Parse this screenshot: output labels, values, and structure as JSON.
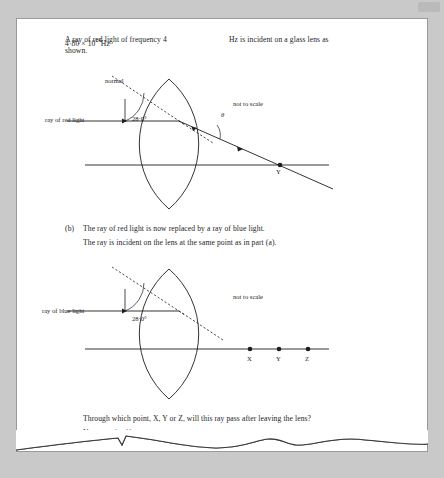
{
  "page": {
    "part_a": {
      "text_before": "A ray of red light of frequency 4",
      "text_full_line1": "A ray of red light of frequency 4·80 × 10",
      "frequency_value": "4·80 × 10",
      "frequency_exponent": "14",
      "frequency_unit": "Hz",
      "line1_tail": "Hz is incident on a glass lens as",
      "line2": "shown."
    },
    "diagram_a": {
      "normal_label": "normal",
      "angle_label": "28·0°",
      "theta_label": "θ",
      "not_to_scale": "not to scale",
      "ray_label": "ray of red light",
      "point_y": "Y"
    },
    "part_b": {
      "marker": "(b)",
      "line1": "The ray of red light is now replaced by a ray of blue light.",
      "line2": "The ray is incident on the lens at the same point as in part (a)."
    },
    "diagram_b": {
      "angle_label": "28·0°",
      "not_to_scale": "not to scale",
      "ray_label": "ray of blue light",
      "points": [
        "X",
        "Y",
        "Z"
      ]
    },
    "question": {
      "line1": "Through which point, X, Y or Z, will this ray pass after leaving the lens?",
      "line2": "You must justify your answer."
    }
  }
}
